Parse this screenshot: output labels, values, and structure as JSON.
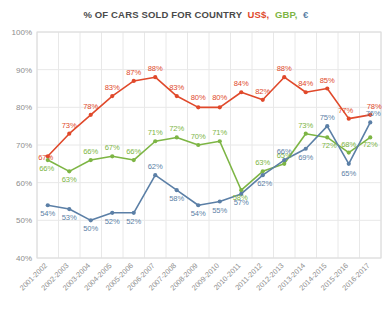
{
  "chart_data": {
    "type": "line",
    "title": "% OF CARS SOLD FOR COUNTRY",
    "xlabel": "",
    "ylabel": "",
    "ylim": [
      40,
      100
    ],
    "ytick_labels": [
      "100%",
      "90%",
      "80%",
      "70%",
      "60%",
      "50%",
      "40%"
    ],
    "yticks": [
      100,
      90,
      80,
      70,
      60,
      50,
      40
    ],
    "grid": true,
    "legend_position": "title-inline",
    "categories": [
      "2001-2002",
      "2002-2003",
      "2003-2004",
      "2004-2005",
      "2005-2006",
      "2006-2007",
      "2007-2008",
      "2008-2009",
      "2009-2010",
      "2010-2011",
      "2011-2012",
      "2012-2013",
      "2013-2014",
      "2014-2015",
      "2015-2016",
      "2016-2017"
    ],
    "series": [
      {
        "name": "US$",
        "color": "#E0492B",
        "values": [
          67,
          73,
          78,
          83,
          87,
          88,
          83,
          80,
          80,
          84,
          82,
          88,
          84,
          85,
          77,
          78
        ],
        "labels": [
          "67%",
          "73%",
          "78%",
          "83%",
          "87%",
          "88%",
          "83%",
          "80%",
          "80%",
          "84%",
          "82%",
          "88%",
          "84%",
          "85%",
          "77%",
          "78%"
        ]
      },
      {
        "name": "GBP",
        "color": "#7DB544",
        "values": [
          66,
          63,
          66,
          67,
          66,
          71,
          72,
          70,
          71,
          58,
          63,
          65,
          73,
          72,
          68,
          72
        ],
        "labels": [
          "66%",
          "63%",
          "66%",
          "67%",
          "66%",
          "71%",
          "72%",
          "70%",
          "71%",
          "58%",
          "63%",
          "65%",
          "73%",
          "72%",
          "68%",
          "72%"
        ]
      },
      {
        "name": "€",
        "color": "#5B7FA6",
        "values": [
          54,
          53,
          50,
          52,
          52,
          62,
          58,
          54,
          55,
          57,
          62,
          66,
          69,
          75,
          65,
          76
        ],
        "labels": [
          "54%",
          "53%",
          "50%",
          "52%",
          "52%",
          "62%",
          "58%",
          "54%",
          "55%",
          "57%",
          "62%",
          "66%",
          "69%",
          "75%",
          "65%",
          "76%"
        ]
      }
    ],
    "legend": [
      {
        "label": "US$",
        "color": "#E0492B"
      },
      {
        "label": "GBP",
        "color": "#7DB544"
      },
      {
        "label": "€",
        "color": "#5B7FA6"
      }
    ]
  },
  "title_parts": {
    "main": "% OF CARS SOLD FOR COUNTRY",
    "usd": "US$",
    "sep1": ",",
    "gbp": "GBP",
    "sep2": ",",
    "eur": "€"
  }
}
